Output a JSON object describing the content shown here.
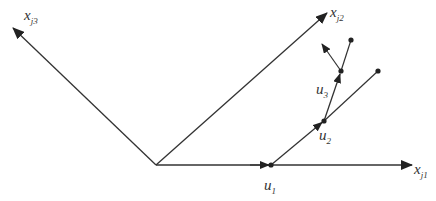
{
  "diagram": {
    "type": "vector-coordinate-diagram",
    "line_color": "#333333",
    "background": "#ffffff",
    "origin": {
      "x": 156,
      "y": 165
    },
    "axes": [
      {
        "id": "xj1",
        "label_main": "x",
        "label_sub": "j1",
        "tip": {
          "x": 412,
          "y": 165
        },
        "label_pos": {
          "x": 414,
          "y": 174
        }
      },
      {
        "id": "xj2",
        "label_main": "x",
        "label_sub": "j2",
        "tip": {
          "x": 327,
          "y": 13
        },
        "label_pos": {
          "x": 330,
          "y": 17
        }
      },
      {
        "id": "xj3",
        "label_main": "x",
        "label_sub": "j3",
        "tip": {
          "x": 13,
          "y": 28
        },
        "label_pos": {
          "x": 24,
          "y": 20
        }
      }
    ],
    "points": [
      {
        "id": "u1",
        "label_main": "u",
        "label_sub": "1",
        "pos": {
          "x": 271,
          "y": 165
        },
        "label_pos": {
          "x": 264,
          "y": 190
        }
      },
      {
        "id": "u2",
        "label_main": "u",
        "label_sub": "2",
        "pos": {
          "x": 324,
          "y": 121
        },
        "label_pos": {
          "x": 319,
          "y": 140
        }
      },
      {
        "id": "u3",
        "label_main": "u",
        "label_sub": "3",
        "pos": {
          "x": 341,
          "y": 71
        },
        "label_pos": {
          "x": 316,
          "y": 94
        }
      }
    ],
    "endpoints": [
      {
        "id": "end-u2-branch",
        "pos": {
          "x": 378,
          "y": 71
        }
      },
      {
        "id": "end-u3-branch",
        "pos": {
          "x": 351,
          "y": 40
        }
      }
    ],
    "extra_arrow": {
      "from": {
        "x": 341,
        "y": 71
      },
      "tip": {
        "x": 322,
        "y": 44
      }
    }
  }
}
